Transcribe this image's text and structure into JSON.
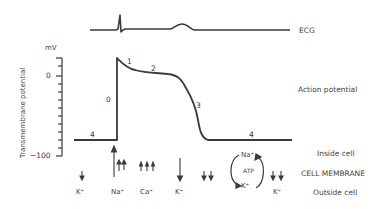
{
  "diagram": {
    "type": "cardiac-action-potential",
    "ecg_label": "ECG",
    "action_potential_label": "Action potential",
    "y_axis": {
      "title": "Transmembrane potential",
      "unit": "mV",
      "tick_labels": [
        "0",
        "−100"
      ],
      "range": [
        -100,
        20
      ]
    },
    "phases": [
      "0",
      "1",
      "2",
      "3",
      "4",
      "4"
    ],
    "membrane_labels": {
      "inside": "Inside cell",
      "membrane": "CELL MEMBRANE",
      "outside": "Outside cell"
    },
    "ions": {
      "k1": "K⁺",
      "na": "Na⁺",
      "ca": "Ca⁺",
      "k2": "K⁺",
      "k3": "K⁺",
      "pump_na": "Na⁺",
      "pump_atp": "ATP",
      "pump_k": "K⁺"
    },
    "colors": {
      "line": "#3a3a3a",
      "text": "#444444",
      "background": "#ffffff"
    }
  }
}
